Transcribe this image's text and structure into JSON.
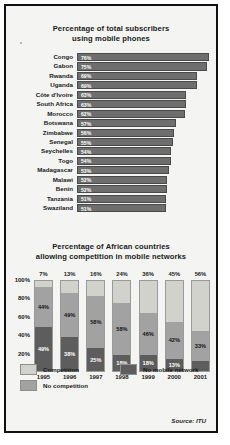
{
  "frame": {
    "background": "#f4f4f2",
    "border_color": "#111111"
  },
  "top": {
    "title_line1": "Percentage of total subscribers",
    "title_line2": "using mobile phones"
  },
  "bottom": {
    "title_line1": "Percentage of African countries",
    "title_line2": "allowing competition in mobile networks"
  },
  "legend": {
    "competition": "Competition",
    "no_competition": "No competition",
    "no_mobile_network": "No mobile network",
    "colors": {
      "competition": "#d2d2cc",
      "no_competition": "#a2a2a2",
      "no_mobile_network": "#5d5d5d"
    }
  },
  "source": "Source: ITU",
  "chart_data": [
    {
      "type": "bar",
      "orientation": "horizontal",
      "title": "Percentage of total subscribers using mobile phones",
      "xlabel": "",
      "ylabel": "",
      "xlim": [
        0,
        80
      ],
      "grid": false,
      "bar_color": "#6e6e6e",
      "categories": [
        "Congo",
        "Gabon",
        "Rwanda",
        "Uganda",
        "Côte d'Ivoire",
        "South Africa",
        "Morocco",
        "Botswana",
        "Zimbabwe",
        "Senegal",
        "Seychelles",
        "Togo",
        "Madagascar",
        "Malawi",
        "Benin",
        "Tanzania",
        "Swaziland"
      ],
      "values": [
        76,
        75,
        69,
        69,
        63,
        63,
        62,
        57,
        56,
        55,
        54,
        54,
        53,
        52,
        52,
        51,
        51
      ],
      "value_labels": [
        "76%",
        "75%",
        "69%",
        "69%",
        "63%",
        "63%",
        "62%",
        "57%",
        "56%",
        "55%",
        "54%",
        "54%",
        "53%",
        "52%",
        "52%",
        "51%",
        "51%"
      ]
    },
    {
      "type": "bar",
      "subtype": "stacked",
      "orientation": "vertical",
      "title": "Percentage of African countries allowing competition in mobile networks",
      "xlabel": "",
      "ylabel": "",
      "ylim": [
        0,
        100
      ],
      "ytick_labels": [
        "100%",
        "80%",
        "60%",
        "40%",
        "20%",
        "0%"
      ],
      "ytick_values": [
        100,
        80,
        60,
        40,
        20,
        0
      ],
      "grid": false,
      "legend_position": "bottom",
      "categories": [
        "1995",
        "1996",
        "1997",
        "1998",
        "1999",
        "2000",
        "2001"
      ],
      "series": [
        {
          "name": "Competition",
          "color": "#d2d2cc",
          "values": [
            7,
            13,
            16,
            24,
            36,
            45,
            56
          ],
          "labels": [
            "7%",
            "13%",
            "16%",
            "24%",
            "36%",
            "45%",
            "56%"
          ]
        },
        {
          "name": "No competition",
          "color": "#a2a2a2",
          "values": [
            44,
            49,
            58,
            58,
            46,
            42,
            33
          ],
          "labels": [
            "44%",
            "49%",
            "58%",
            "58%",
            "46%",
            "42%",
            "33%"
          ]
        },
        {
          "name": "No mobile network",
          "color": "#5d5d5d",
          "values": [
            49,
            38,
            25,
            18,
            18,
            13,
            11
          ],
          "labels": [
            "49%",
            "38%",
            "25%",
            "18%",
            "18%",
            "13%",
            ""
          ]
        }
      ]
    }
  ]
}
